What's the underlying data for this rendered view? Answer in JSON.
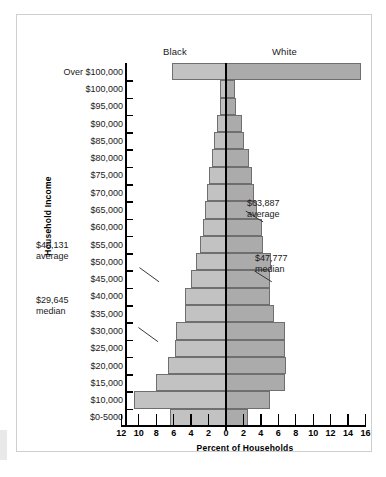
{
  "figure": {
    "group_labels": {
      "left": "Black",
      "right": "White"
    },
    "y_axis_title": "Household Income",
    "x_axis_title": "Percent of Households"
  },
  "annotations": [
    {
      "id": "black-average",
      "value": "$40,131",
      "kind": "average",
      "side": "left"
    },
    {
      "id": "black-median",
      "value": "$29,645",
      "kind": "median",
      "side": "left"
    },
    {
      "id": "white-average",
      "value": "$63,887",
      "kind": "average",
      "side": "right"
    },
    {
      "id": "white-median",
      "value": "$47,777",
      "kind": "median",
      "side": "right"
    }
  ],
  "chart_data": {
    "type": "bar",
    "subtype": "population-pyramid",
    "title": "",
    "xlabel": "Percent of Households",
    "ylabel": "Household Income",
    "orientation": "horizontal",
    "grid": false,
    "legend_position": "top",
    "x_tick_labels": [
      "12",
      "10",
      "8",
      "6",
      "4",
      "2",
      "0",
      "2",
      "4",
      "6",
      "8",
      "10",
      "12",
      "14",
      "16"
    ],
    "x_tick_values": [
      -12,
      -10,
      -8,
      -6,
      -4,
      -2,
      0,
      2,
      4,
      6,
      8,
      10,
      12,
      14,
      16
    ],
    "xlim": [
      -13,
      17
    ],
    "categories": [
      "Over $100,000",
      "$100,000",
      "$95,000",
      "$90,000",
      "$85,000",
      "$80,000",
      "$75,000",
      "$70,000",
      "$65,000",
      "$60,000",
      "$55,000",
      "$50,000",
      "$45,000",
      "$40,000",
      "$35,000",
      "$30,000",
      "$25,000",
      "$20,000",
      "$15,000",
      "$10,000",
      "$0-5000"
    ],
    "series": [
      {
        "name": "Black",
        "direction": "left",
        "color": "#c2c2c2",
        "values": [
          6.2,
          0.7,
          0.7,
          1.0,
          1.4,
          1.6,
          1.9,
          2.2,
          2.4,
          2.6,
          3.0,
          3.4,
          4.0,
          4.7,
          4.7,
          5.7,
          5.8,
          6.6,
          8.0,
          10.6,
          6.4
        ]
      },
      {
        "name": "White",
        "direction": "right",
        "color": "#ababab",
        "values": [
          15.5,
          1.0,
          1.2,
          1.8,
          2.1,
          2.6,
          3.0,
          3.2,
          3.6,
          4.1,
          4.2,
          5.2,
          5.0,
          5.0,
          5.5,
          6.8,
          6.8,
          6.9,
          6.8,
          5.0,
          2.5
        ]
      }
    ],
    "annotations": [
      {
        "label": "$40,131",
        "sublabel": "average",
        "series": "Black",
        "row": "$40,000"
      },
      {
        "label": "$29,645",
        "sublabel": "median",
        "series": "Black",
        "row": "$30,000"
      },
      {
        "label": "$63,887",
        "sublabel": "average",
        "series": "White",
        "row": "$60,000"
      },
      {
        "label": "$47,777",
        "sublabel": "median",
        "series": "White",
        "row": "$50,000"
      }
    ]
  }
}
